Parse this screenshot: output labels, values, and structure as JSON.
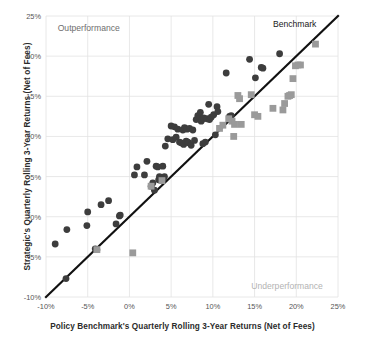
{
  "chart_data": {
    "type": "scatter",
    "title": "",
    "xlabel": "Policy Benchmark's Quarterly Rolling 3-Year Returns (Net of Fees)",
    "ylabel": "Strategic's Quarterly Rolling 3-Year Returns (Net of Fees)",
    "xlim": [
      -10,
      25
    ],
    "ylim": [
      -10,
      25
    ],
    "grid": true,
    "legend_position": "none",
    "xticks": [
      -10,
      -5,
      0,
      5,
      10,
      15,
      20,
      25
    ],
    "xticklabels": [
      "-10%",
      "-5%",
      "0%",
      "5%",
      "10%",
      "15%",
      "20%",
      "25%"
    ],
    "yticks": [
      -10,
      -5,
      0,
      5,
      10,
      15,
      20,
      25
    ],
    "yticklabels": [
      "-10%",
      "-5%",
      "0%",
      "5%",
      "10%",
      "15%",
      "20%",
      "25%"
    ],
    "annotations": [
      {
        "text": "Outperformance",
        "x": -8.6,
        "y": 23.4,
        "color": "#6e6e6e"
      },
      {
        "text": "Benchmark",
        "x": 17.2,
        "y": 23.9,
        "color": "#1a1a1a"
      },
      {
        "text": "Underperformance",
        "x": 14.6,
        "y": -8.7,
        "color": "#b3b3b3"
      }
    ],
    "reference_line": {
      "name": "Benchmark 45-degree parity line",
      "from": [
        -10,
        -10
      ],
      "to": [
        25,
        25
      ],
      "color": "#111111",
      "width": 2.2
    },
    "series": [
      {
        "name": "Dark circle observations",
        "marker": "circle",
        "color": "#3d3d3d",
        "size": 3.4,
        "points": [
          [
            -8.9,
            -3.4
          ],
          [
            -7.5,
            -1.6
          ],
          [
            -7.6,
            -7.7
          ],
          [
            -5.1,
            -1.1
          ],
          [
            -5.0,
            0.6
          ],
          [
            -4.1,
            -4.0
          ],
          [
            -3.9,
            -4.1
          ],
          [
            -3.4,
            1.5
          ],
          [
            -2.5,
            2.0
          ],
          [
            -1.6,
            -0.9
          ],
          [
            -1.2,
            0.1
          ],
          [
            -1.1,
            0.2
          ],
          [
            0.6,
            5.2
          ],
          [
            0.9,
            6.2
          ],
          [
            1.8,
            5.2
          ],
          [
            2.1,
            6.9
          ],
          [
            2.6,
            3.8
          ],
          [
            2.8,
            4.2
          ],
          [
            3.0,
            3.3
          ],
          [
            3.2,
            6.3
          ],
          [
            3.4,
            6.2
          ],
          [
            3.5,
            4.6
          ],
          [
            3.6,
            5.0
          ],
          [
            3.8,
            4.9
          ],
          [
            3.9,
            4.5
          ],
          [
            4.0,
            6.3
          ],
          [
            4.1,
            4.8
          ],
          [
            4.2,
            5.0
          ],
          [
            4.3,
            8.8
          ],
          [
            4.6,
            9.7
          ],
          [
            5.0,
            11.3
          ],
          [
            5.2,
            9.6
          ],
          [
            5.4,
            11.2
          ],
          [
            5.6,
            9.9
          ],
          [
            5.8,
            10.9
          ],
          [
            6.0,
            9.3
          ],
          [
            6.2,
            9.2
          ],
          [
            6.4,
            10.8
          ],
          [
            6.5,
            9.0
          ],
          [
            6.6,
            11.1
          ],
          [
            6.8,
            9.4
          ],
          [
            6.9,
            10.9
          ],
          [
            7.0,
            9.3
          ],
          [
            7.1,
            9.2
          ],
          [
            7.2,
            11.0
          ],
          [
            7.4,
            8.9
          ],
          [
            7.6,
            10.8
          ],
          [
            7.8,
            9.5
          ],
          [
            8.0,
            12.1
          ],
          [
            8.2,
            12.6
          ],
          [
            8.4,
            12.3
          ],
          [
            8.5,
            13.0
          ],
          [
            8.6,
            11.9
          ],
          [
            8.7,
            12.1
          ],
          [
            8.8,
            9.1
          ],
          [
            8.9,
            12.3
          ],
          [
            9.1,
            9.3
          ],
          [
            9.3,
            12.2
          ],
          [
            9.5,
            14.0
          ],
          [
            9.6,
            12.1
          ],
          [
            9.8,
            12.4
          ],
          [
            10.1,
            12.7
          ],
          [
            10.3,
            10.2
          ],
          [
            10.5,
            13.7
          ],
          [
            10.6,
            13.1
          ],
          [
            11.6,
            17.9
          ],
          [
            12.0,
            12.5
          ],
          [
            12.1,
            12.3
          ],
          [
            12.2,
            12.6
          ],
          [
            14.4,
            19.6
          ],
          [
            15.1,
            17.3
          ],
          [
            15.8,
            18.6
          ],
          [
            16.0,
            18.5
          ],
          [
            18.0,
            20.3
          ]
        ]
      },
      {
        "name": "Gray square observations",
        "marker": "square",
        "color": "#9a9a9a",
        "size": 3.4,
        "points": [
          [
            -3.9,
            -4.1
          ],
          [
            0.4,
            -4.5
          ],
          [
            2.6,
            3.8
          ],
          [
            3.9,
            4.5
          ],
          [
            10.8,
            11.0
          ],
          [
            11.2,
            11.4
          ],
          [
            11.9,
            12.2
          ],
          [
            12.3,
            11.9
          ],
          [
            12.5,
            10.0
          ],
          [
            12.6,
            11.5
          ],
          [
            13.0,
            15.1
          ],
          [
            13.2,
            14.7
          ],
          [
            13.4,
            11.5
          ],
          [
            14.6,
            15.2
          ],
          [
            15.0,
            12.7
          ],
          [
            15.4,
            12.5
          ],
          [
            17.2,
            13.5
          ],
          [
            18.4,
            13.3
          ],
          [
            18.6,
            14.1
          ],
          [
            19.0,
            15.0
          ],
          [
            19.2,
            15.1
          ],
          [
            19.4,
            15.2
          ],
          [
            19.6,
            17.2
          ],
          [
            19.9,
            18.8
          ],
          [
            20.2,
            18.9
          ],
          [
            20.5,
            18.9
          ],
          [
            22.3,
            21.5
          ]
        ]
      }
    ]
  }
}
